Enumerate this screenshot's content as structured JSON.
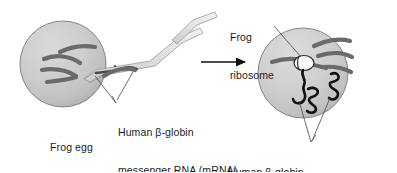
{
  "figure": {
    "type": "biology-process-diagram"
  },
  "labels": {
    "frog_egg": "Frog egg",
    "mrna_line1": "Human β-globin",
    "mrna_line2": "messenger RNA (mRNA)",
    "ribosome_line1": "Frog",
    "ribosome_line2": "ribosome",
    "synthesis_line1": "Human β-globin",
    "synthesis_line2": "synthesis"
  },
  "elements": {
    "left_cell": "frog-egg-cell",
    "micropipette": "injection-micropipette",
    "process_arrow": "rightward-process-arrow",
    "right_cell": "frog-egg-cell-after-injection",
    "ribosome": "frog-ribosome",
    "nascent_chain": "nascent-polypeptide-chain",
    "folded_protein_upper": "folded-beta-globin-protein",
    "folded_protein_lower": "folded-beta-globin-protein"
  },
  "colors": {
    "background": "#ffffff",
    "cytoplasm_light": "#d2d2d2",
    "cytoplasm_mid": "#c3c3c3",
    "cytoplasm_shadow": "#a9a9a9",
    "cell_outline": "#6d6d6d",
    "chromosome": "#6a6a6a",
    "protein_black": "#111111",
    "ribosome_fill": "#fdfdfd",
    "leader_line": "#4a4a4a",
    "pipette_outline": "#9a9a9a",
    "text": "#1a1a1a"
  }
}
